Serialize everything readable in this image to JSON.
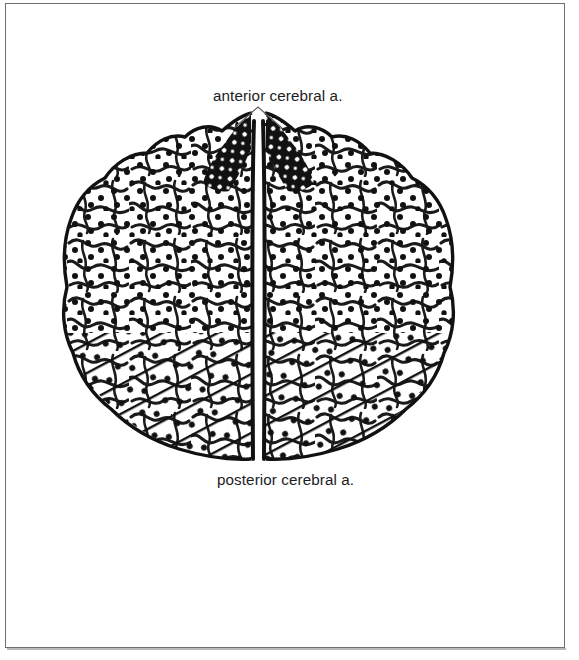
{
  "figure": {
    "title_visible": false,
    "view": "superior view of cerebral hemispheres showing arterial territories",
    "background_color": "#ffffff",
    "ink_color": "#111111",
    "frame_color": "#6f6f72",
    "labels": {
      "anterior": "anterior cerebral a.",
      "posterior": "posterior cerebral a."
    },
    "leader_lines": {
      "anterior": "inverted-V leader from label down to both medial strips",
      "posterior": "none"
    },
    "territories": [
      {
        "name": "anterior cerebral a.",
        "shading": "solid dense black hatching",
        "location": "paramedian strips, anterior/frontal medial margins of both hemispheres"
      },
      {
        "name": "middle cerebral a.",
        "shading": "stippled dots, unlabeled",
        "location": "lateral convexity of both hemispheres"
      },
      {
        "name": "posterior cerebral a.",
        "shading": "diagonal line hatching with dots",
        "location": "posterior/occipital region of both hemispheres"
      }
    ]
  }
}
